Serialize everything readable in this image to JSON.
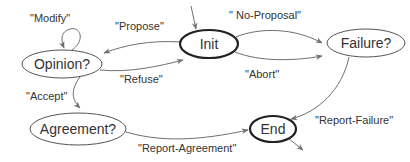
{
  "diagram": {
    "type": "state-machine",
    "nodes": [
      {
        "id": "init",
        "label": "Init",
        "cx": 209,
        "cy": 44,
        "rx": 29,
        "ry": 14,
        "style": "thick"
      },
      {
        "id": "opinion",
        "label": "Opinion?",
        "cx": 62,
        "cy": 64,
        "rx": 40,
        "ry": 14,
        "style": "thin"
      },
      {
        "id": "failure",
        "label": "Failure?",
        "cx": 366,
        "cy": 43,
        "rx": 39,
        "ry": 14,
        "style": "thin"
      },
      {
        "id": "agreement",
        "label": "Agreement?",
        "cx": 78,
        "cy": 129,
        "rx": 48,
        "ry": 16,
        "style": "thin"
      },
      {
        "id": "end",
        "label": "End",
        "cx": 273,
        "cy": 129,
        "rx": 23,
        "ry": 13,
        "style": "thick"
      }
    ],
    "edges": [
      {
        "from": "start",
        "to": "init",
        "label": ""
      },
      {
        "from": "init",
        "to": "opinion",
        "label": "\"Propose\""
      },
      {
        "from": "opinion",
        "to": "init",
        "label": "\"Refuse\""
      },
      {
        "from": "opinion",
        "to": "opinion",
        "label": "\"Modify\""
      },
      {
        "from": "opinion",
        "to": "agreement",
        "label": "\"Accept\""
      },
      {
        "from": "init",
        "to": "failure",
        "label": "\" No-Proposal\""
      },
      {
        "from": "init",
        "to": "failure",
        "label": "\"Abort\""
      },
      {
        "from": "failure",
        "to": "end",
        "label": "\"Report-Failure\""
      },
      {
        "from": "agreement",
        "to": "end",
        "label": "\"Report-Agreement\""
      },
      {
        "from": "end",
        "to": "exit",
        "label": ""
      }
    ],
    "colors": {
      "node_stroke": "#555555",
      "terminal_stroke": "#222222",
      "edge_stroke": "#6e6e6e",
      "text": "#333333",
      "background": "#ffffff"
    }
  }
}
